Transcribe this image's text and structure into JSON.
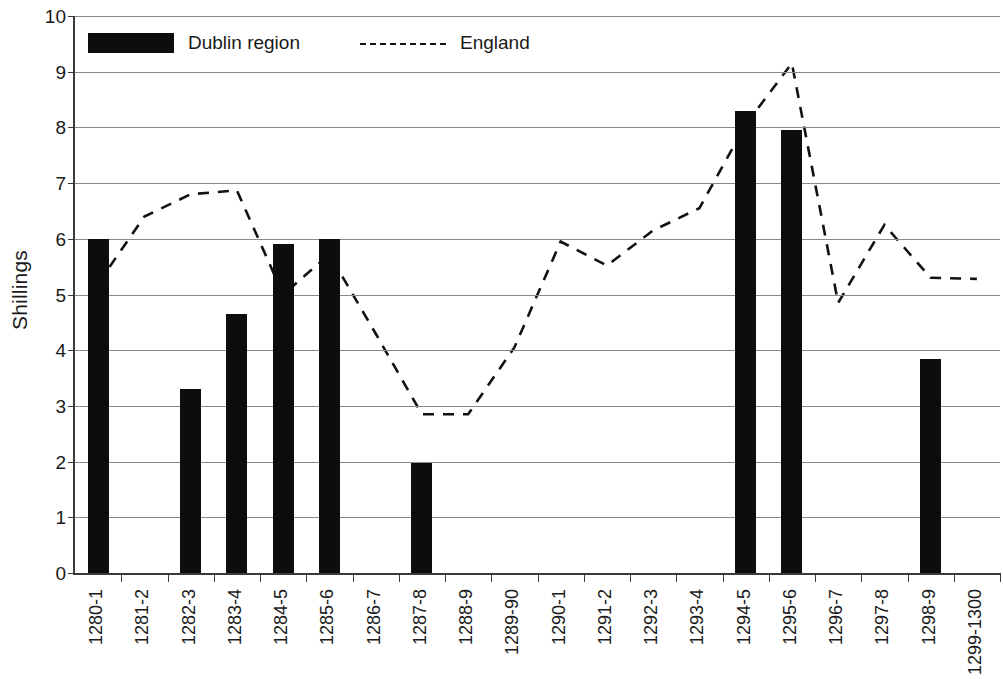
{
  "chart_data": {
    "type": "bar",
    "title": "",
    "xlabel": "",
    "ylabel": "Shillings",
    "ylim": [
      0,
      10
    ],
    "y_ticks": [
      0,
      1,
      2,
      3,
      4,
      5,
      6,
      7,
      8,
      9,
      10
    ],
    "grid": true,
    "legend_position": "top-left-inside",
    "categories": [
      "1280-1",
      "1281-2",
      "1282-3",
      "1283-4",
      "1284-5",
      "1285-6",
      "1286-7",
      "1287-8",
      "1288-9",
      "1289-90",
      "1290-1",
      "1291-2",
      "1292-3",
      "1293-4",
      "1294-5",
      "1295-6",
      "1296-7",
      "1297-8",
      "1298-9",
      "1299-1300"
    ],
    "series": [
      {
        "name": "Dublin region",
        "type": "bar",
        "color": "#0d0d0d",
        "values": [
          6.0,
          null,
          3.3,
          4.65,
          5.9,
          6.0,
          null,
          1.97,
          null,
          null,
          null,
          null,
          null,
          null,
          8.3,
          7.95,
          null,
          null,
          3.84,
          null
        ]
      },
      {
        "name": "England",
        "type": "line",
        "style": "dashed",
        "color": "#111111",
        "values": [
          5.2,
          6.4,
          6.8,
          6.87,
          5.0,
          5.72,
          4.3,
          2.85,
          2.85,
          4.05,
          5.95,
          5.52,
          6.15,
          6.55,
          8.05,
          9.15,
          4.85,
          6.25,
          5.3,
          5.28
        ]
      }
    ]
  },
  "legend": {
    "entries": [
      {
        "label": "Dublin region",
        "swatch": "bar-swatch"
      },
      {
        "label": "England",
        "swatch": "dashed-line-swatch"
      }
    ]
  },
  "axes": {
    "y_title": "Shillings"
  }
}
